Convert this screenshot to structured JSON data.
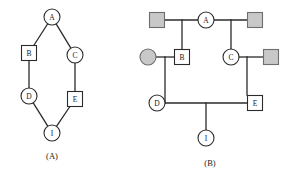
{
  "figure": {
    "width": 294,
    "height": 176,
    "background": "#ffffff",
    "stroke_color": "#2b2b2b",
    "node_fill": "#ffffff",
    "shaded_fill": "#c8c8c8",
    "shaded_stroke": "#6e6e6e"
  },
  "panels": [
    {
      "id": "panel-a",
      "caption": "(A)",
      "caption_pos": {
        "x": 52,
        "y": 156
      },
      "type": "graph",
      "nodes": [
        {
          "id": "A",
          "label": "A",
          "shape": "circle",
          "x": 52,
          "y": 17,
          "r": 8,
          "fill": "white"
        },
        {
          "id": "B",
          "label": "B",
          "shape": "square",
          "x": 29,
          "y": 53,
          "s": 15,
          "fill": "white"
        },
        {
          "id": "C",
          "label": "C",
          "shape": "circle",
          "x": 75,
          "y": 55,
          "r": 8,
          "fill": "white"
        },
        {
          "id": "D",
          "label": "D",
          "shape": "circle",
          "x": 29,
          "y": 96,
          "r": 8,
          "fill": "white"
        },
        {
          "id": "E",
          "label": "E",
          "shape": "square",
          "x": 75,
          "y": 99,
          "s": 15,
          "fill": "white"
        },
        {
          "id": "I",
          "label": "I",
          "shape": "circle",
          "x": 52,
          "y": 133,
          "r": 8,
          "fill": "white"
        }
      ],
      "edges": [
        {
          "from": "A",
          "to": "B"
        },
        {
          "from": "A",
          "to": "C"
        },
        {
          "from": "B",
          "to": "D"
        },
        {
          "from": "C",
          "to": "E"
        },
        {
          "from": "D",
          "to": "I"
        },
        {
          "from": "E",
          "to": "I"
        }
      ]
    },
    {
      "id": "panel-b",
      "caption": "(B)",
      "caption_pos": {
        "x": 210,
        "y": 163
      },
      "type": "pedigree",
      "nodes": [
        {
          "id": "sq-top-left",
          "label": "",
          "shape": "square",
          "x": 157,
          "y": 20,
          "s": 15,
          "fill": "shaded"
        },
        {
          "id": "A",
          "label": "A",
          "shape": "circle",
          "x": 206,
          "y": 20,
          "r": 8,
          "fill": "white"
        },
        {
          "id": "sq-top-right",
          "label": "",
          "shape": "square",
          "x": 255,
          "y": 20,
          "s": 15,
          "fill": "shaded"
        },
        {
          "id": "ci-mid-left",
          "label": "",
          "shape": "circle",
          "x": 148,
          "y": 57,
          "r": 8,
          "fill": "shaded"
        },
        {
          "id": "B",
          "label": "B",
          "shape": "square",
          "x": 182,
          "y": 57,
          "s": 15,
          "fill": "white"
        },
        {
          "id": "C",
          "label": "C",
          "shape": "circle",
          "x": 231,
          "y": 57,
          "r": 8,
          "fill": "white"
        },
        {
          "id": "sq-mid-right",
          "label": "",
          "shape": "square",
          "x": 271,
          "y": 57,
          "s": 15,
          "fill": "shaded"
        },
        {
          "id": "D",
          "label": "D",
          "shape": "circle",
          "x": 157,
          "y": 103,
          "r": 8,
          "fill": "white"
        },
        {
          "id": "E",
          "label": "E",
          "shape": "square",
          "x": 255,
          "y": 103,
          "s": 15,
          "fill": "white"
        },
        {
          "id": "I",
          "label": "I",
          "shape": "circle",
          "x": 206,
          "y": 138,
          "r": 8,
          "fill": "white"
        }
      ],
      "lines": [
        {
          "name": "union-topleft-A",
          "x1": 165,
          "y1": 20,
          "x2": 198,
          "y2": 20
        },
        {
          "name": "union-A-topright",
          "x1": 214,
          "y1": 20,
          "x2": 247,
          "y2": 20
        },
        {
          "name": "descent-to-B",
          "x1": 182,
          "y1": 20,
          "x2": 182,
          "y2": 49
        },
        {
          "name": "descent-to-C",
          "x1": 231,
          "y1": 20,
          "x2": 231,
          "y2": 49
        },
        {
          "name": "union-left-B",
          "x1": 156,
          "y1": 57,
          "x2": 174,
          "y2": 57
        },
        {
          "name": "union-C-right",
          "x1": 239,
          "y1": 57,
          "x2": 263,
          "y2": 57
        },
        {
          "name": "descent-to-D",
          "x1": 165,
          "y1": 57,
          "x2": 165,
          "y2": 103
        },
        {
          "name": "d-stub-left",
          "x1": 157,
          "y1": 103,
          "x2": 165,
          "y2": 103
        },
        {
          "name": "descent-to-E",
          "x1": 247,
          "y1": 57,
          "x2": 247,
          "y2": 95
        },
        {
          "name": "union-D-E",
          "x1": 165,
          "y1": 103,
          "x2": 247,
          "y2": 103
        },
        {
          "name": "descent-to-I",
          "x1": 206,
          "y1": 103,
          "x2": 206,
          "y2": 130
        }
      ]
    }
  ]
}
